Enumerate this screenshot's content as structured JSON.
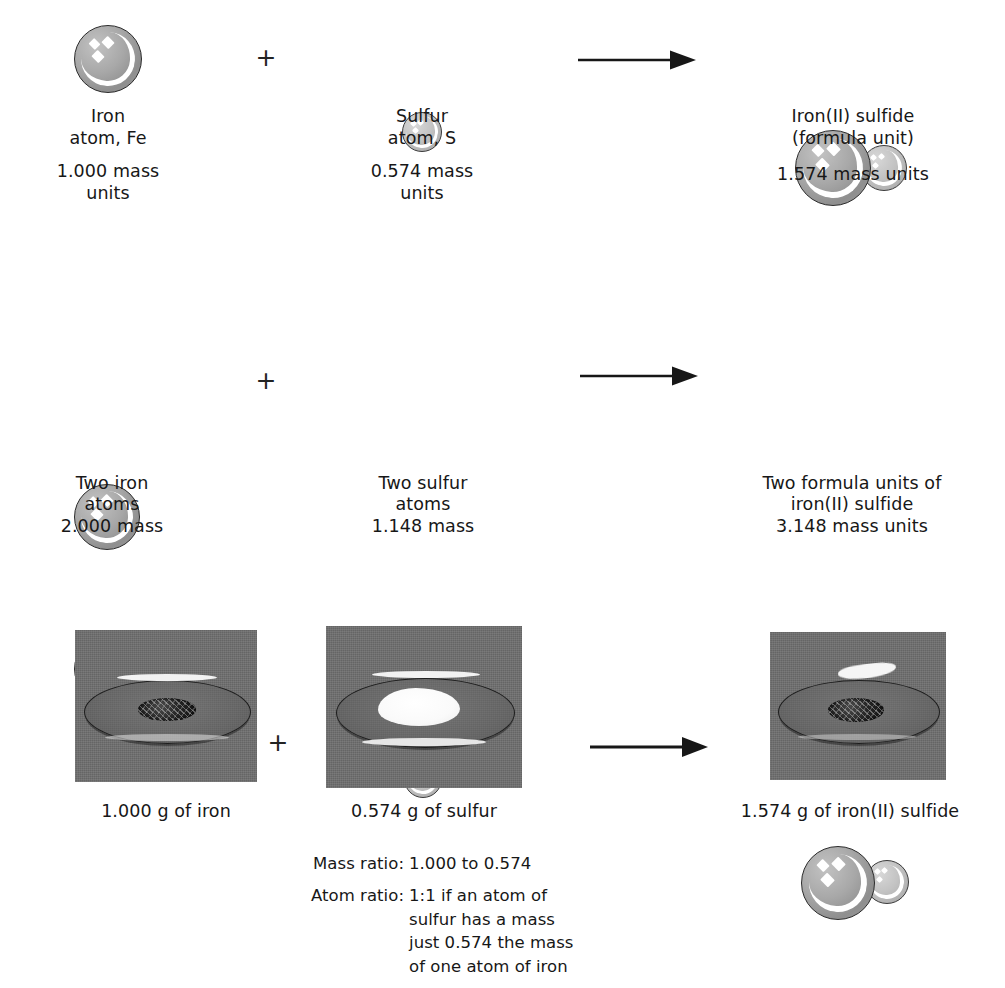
{
  "figure": {
    "operators": {
      "plus": "+",
      "arrow": "arrow-right"
    }
  },
  "row_atoms": {
    "reactant1": {
      "name_line1": "Iron",
      "name_line2": "atom, Fe",
      "mass_line1": "1.000 mass",
      "mass_line2": "units",
      "caption": "Iron\natom, Fe",
      "mass": "1.000 mass\nunits",
      "species": "Fe"
    },
    "operator_plus": "+",
    "reactant2": {
      "caption": "Sulfur\natom, S",
      "mass": "0.574 mass\nunits",
      "species": "S"
    },
    "product": {
      "caption": "Iron(II) sulfide\n(formula unit)",
      "mass": "1.574 mass units",
      "species": "FeS"
    }
  },
  "row_two_atoms": {
    "reactant1": {
      "caption": "Two iron\natoms\n2.000 mass",
      "species": "2 Fe"
    },
    "operator_plus": "+",
    "reactant2": {
      "caption": "Two sulfur\natoms\n1.148 mass",
      "species": "2 S"
    },
    "product": {
      "caption": "Two formula units of\niron(II) sulfide\n3.148 mass units",
      "species": "2 FeS"
    }
  },
  "row_photos": {
    "reactant1": {
      "caption": "1.000 g of iron",
      "alt": "watch-glass-with-dark-iron-filings"
    },
    "operator_plus": "+",
    "reactant2": {
      "caption": "0.574 g of sulfur",
      "alt": "watch-glass-with-white-sulfur-powder"
    },
    "product": {
      "caption": "1.574 g of iron(II) sulfide",
      "alt": "watch-glass-with-dark-iron-sulfide"
    }
  },
  "ratios": {
    "mass_label": "Mass ratio:",
    "mass_value": "1.000 to 0.574",
    "atom_label": "Atom ratio:",
    "atom_value": "1:1 if an atom of\nsulfur has a mass\njust 0.574 the mass\nof one atom of iron"
  },
  "colors": {
    "background": "#ffffff",
    "text": "#171717",
    "iron_sphere": "#a8a8a8",
    "sulfur_sphere": "#c3c3c3",
    "sphere_outline": "#2b2b2b",
    "photo_background": "#6e6e6e",
    "arrow": "#171717"
  }
}
